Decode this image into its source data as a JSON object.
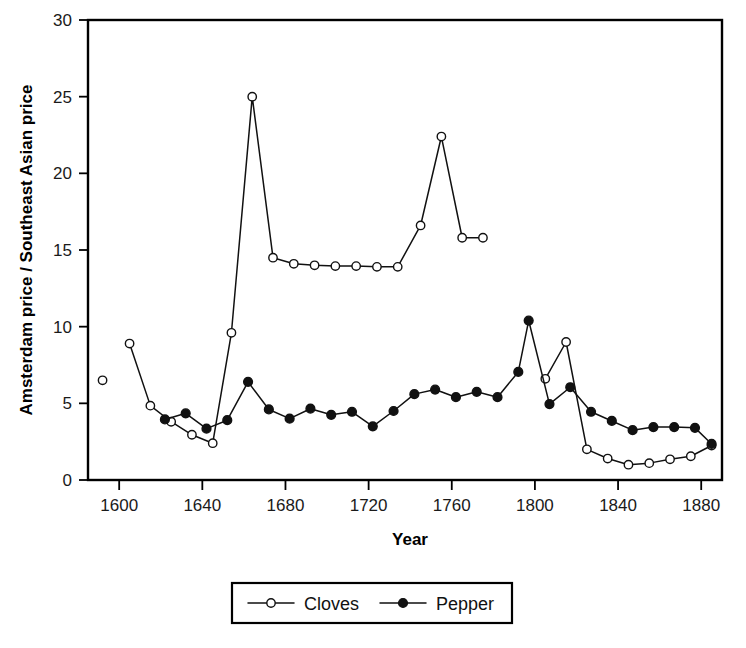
{
  "chart_data": {
    "type": "line",
    "title": "",
    "xlabel": "Year",
    "ylabel": "Amsterdam price / Southeast Asian price",
    "xlim": [
      1585,
      1890
    ],
    "ylim": [
      0,
      30
    ],
    "grid": false,
    "legend_position": "bottom-center",
    "x_ticks": [
      1600,
      1640,
      1680,
      1720,
      1760,
      1800,
      1840,
      1880
    ],
    "x_tick_labels": [
      "1600",
      "1640",
      "1680",
      "1720",
      "1760",
      "1800",
      "1840",
      "1880"
    ],
    "y_ticks": [
      0,
      5,
      10,
      15,
      20,
      25,
      30
    ],
    "y_tick_labels": [
      "0",
      "5",
      "10",
      "15",
      "20",
      "25",
      "30"
    ],
    "series": [
      {
        "name": "Cloves",
        "marker": "open-circle",
        "points": [
          {
            "x": 1592,
            "y": 6.5,
            "detached": true
          },
          {
            "x": 1605,
            "y": 8.9
          },
          {
            "x": 1615,
            "y": 4.85
          },
          {
            "x": 1625,
            "y": 3.8
          },
          {
            "x": 1635,
            "y": 2.95
          },
          {
            "x": 1645,
            "y": 2.4
          },
          {
            "x": 1654,
            "y": 9.6
          },
          {
            "x": 1664,
            "y": 25.0
          },
          {
            "x": 1674,
            "y": 14.5
          },
          {
            "x": 1684,
            "y": 14.1
          },
          {
            "x": 1694,
            "y": 14.0
          },
          {
            "x": 1704,
            "y": 13.95
          },
          {
            "x": 1714,
            "y": 13.95
          },
          {
            "x": 1724,
            "y": 13.9
          },
          {
            "x": 1734,
            "y": 13.9
          },
          {
            "x": 1745,
            "y": 16.6
          },
          {
            "x": 1755,
            "y": 22.4
          },
          {
            "x": 1765,
            "y": 15.8
          },
          {
            "x": 1775,
            "y": 15.8
          }
        ],
        "segments": [
          [
            0
          ],
          [
            1,
            2,
            3,
            4,
            5,
            6,
            7,
            8,
            9,
            10,
            11,
            12,
            13,
            14,
            15,
            16,
            17,
            18
          ]
        ]
      },
      {
        "name": "Cloves",
        "marker": "open-circle",
        "continued": true,
        "points": [
          {
            "x": 1805,
            "y": 6.6
          },
          {
            "x": 1815,
            "y": 9.0
          },
          {
            "x": 1825,
            "y": 2.0
          },
          {
            "x": 1835,
            "y": 1.4
          },
          {
            "x": 1845,
            "y": 1.0
          },
          {
            "x": 1855,
            "y": 1.1
          },
          {
            "x": 1865,
            "y": 1.35
          },
          {
            "x": 1875,
            "y": 1.55
          },
          {
            "x": 1885,
            "y": 2.25
          }
        ]
      },
      {
        "name": "Pepper",
        "marker": "filled-circle",
        "points": [
          {
            "x": 1622,
            "y": 3.95
          },
          {
            "x": 1632,
            "y": 4.35
          },
          {
            "x": 1642,
            "y": 3.35
          },
          {
            "x": 1652,
            "y": 3.9
          },
          {
            "x": 1662,
            "y": 6.4
          },
          {
            "x": 1672,
            "y": 4.6
          },
          {
            "x": 1682,
            "y": 4.0
          },
          {
            "x": 1692,
            "y": 4.65
          },
          {
            "x": 1702,
            "y": 4.25
          },
          {
            "x": 1712,
            "y": 4.45
          },
          {
            "x": 1722,
            "y": 3.5
          },
          {
            "x": 1732,
            "y": 4.5
          },
          {
            "x": 1742,
            "y": 5.6
          },
          {
            "x": 1752,
            "y": 5.9
          },
          {
            "x": 1762,
            "y": 5.4
          },
          {
            "x": 1772,
            "y": 5.75
          },
          {
            "x": 1782,
            "y": 5.4
          },
          {
            "x": 1792,
            "y": 7.05
          },
          {
            "x": 1797,
            "y": 10.4
          },
          {
            "x": 1807,
            "y": 4.95
          },
          {
            "x": 1817,
            "y": 6.05
          },
          {
            "x": 1827,
            "y": 4.45
          },
          {
            "x": 1837,
            "y": 3.85
          },
          {
            "x": 1847,
            "y": 3.25
          },
          {
            "x": 1857,
            "y": 3.45
          },
          {
            "x": 1867,
            "y": 3.45
          },
          {
            "x": 1877,
            "y": 3.4
          },
          {
            "x": 1885,
            "y": 2.35
          }
        ]
      }
    ],
    "legend": [
      {
        "label": "Cloves",
        "marker": "open-circle"
      },
      {
        "label": "Pepper",
        "marker": "filled-circle"
      }
    ]
  },
  "colors": {
    "ink": "#000000",
    "line": "#111111",
    "background": "#ffffff",
    "marker_fill_open": "#ffffff",
    "marker_fill_filled": "#111111"
  }
}
